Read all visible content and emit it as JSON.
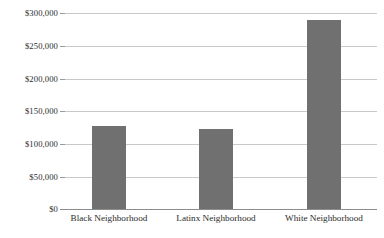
{
  "chart_data": {
    "type": "bar",
    "title": "",
    "subtitle": "",
    "xlabel": "",
    "ylabel": "",
    "categories": [
      "Black Neighborhood",
      "Latinx Neighborhood",
      "White Neighborhood"
    ],
    "values": [
      127000,
      122000,
      289000
    ],
    "value_labels": [
      "$127,000",
      "$122,000",
      "$289,000"
    ],
    "series": [
      {
        "name": "Home value",
        "values": [
          127000,
          122000,
          289000
        ]
      }
    ],
    "ylim": [
      0,
      300000
    ],
    "ytick_values": [
      0,
      50000,
      100000,
      150000,
      200000,
      250000,
      300000
    ],
    "ytick_labels": [
      "$0",
      "$50,000",
      "$100,000",
      "$150,000",
      "$200,000",
      "$250,000",
      "$300,000"
    ],
    "grid": true,
    "grid_axis": "y",
    "legend": false,
    "legend_position": "none",
    "bar_color": "#707070",
    "gridline_color": "#c9c9c9",
    "axis_color": "#8c8c8c",
    "background_color": "#ffffff",
    "annotations": []
  },
  "axes": {
    "y": {
      "ticks": [
        {
          "label": "$300,000",
          "value": 300000
        },
        {
          "label": "$250,000",
          "value": 250000
        },
        {
          "label": "$200,000",
          "value": 200000
        },
        {
          "label": "$150,000",
          "value": 150000
        },
        {
          "label": "$100,000",
          "value": 100000
        },
        {
          "label": "$50,000",
          "value": 50000
        },
        {
          "label": "$0",
          "value": 0
        }
      ]
    },
    "x": {
      "ticks": [
        {
          "label": "Black Neighborhood"
        },
        {
          "label": "Latinx Neighborhood"
        },
        {
          "label": "White Neighborhood"
        }
      ]
    }
  }
}
